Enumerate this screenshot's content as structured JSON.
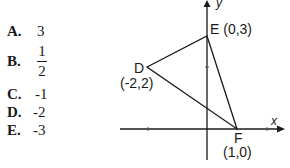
{
  "answer_choices": [
    {
      "letter": "A.",
      "value": "3"
    },
    {
      "letter": "B.",
      "numerator": "1",
      "denominator": "2"
    },
    {
      "letter": "C.",
      "value": "-1"
    },
    {
      "letter": "D.",
      "value": "-2"
    },
    {
      "letter": "E.",
      "value": "-3"
    }
  ],
  "diagram": {
    "x_axis_label": "x",
    "y_axis_label": "y",
    "points": {
      "D": {
        "name": "D",
        "coords": "(-2,2)"
      },
      "E": {
        "name": "E",
        "coords": "E (0,3)"
      },
      "F": {
        "name": "F",
        "coords": "(1,0)"
      }
    }
  }
}
